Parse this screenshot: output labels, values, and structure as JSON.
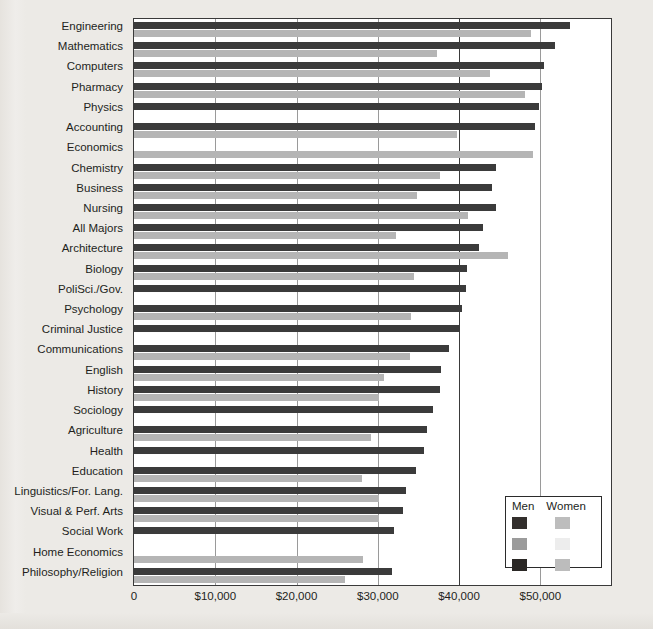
{
  "chart_data": {
    "type": "bar",
    "orientation": "horizontal",
    "title": "",
    "subtitle": "",
    "xlabel": "",
    "ylabel": "",
    "xlim": [
      0,
      58700
    ],
    "xticks": [
      0,
      10000,
      20000,
      30000,
      40000,
      50000
    ],
    "xtick_labels": [
      "0",
      "$10,000",
      "$20,000",
      "$30,000",
      "$40,000",
      "$50,000"
    ],
    "grid": true,
    "legend_position": "bottom-right",
    "categories": [
      "Engineering",
      "Mathematics",
      "Computers",
      "Pharmacy",
      "Physics",
      "Accounting",
      "Economics",
      "Chemistry",
      "Business",
      "Nursing",
      "All Majors",
      "Architecture",
      "Biology",
      "PoliSci./Gov.",
      "Psychology",
      "Criminal Justice",
      "Communications",
      "English",
      "History",
      "Sociology",
      "Agriculture",
      "Health",
      "Education",
      "Linguistics/For. Lang.",
      "Visual & Perf. Arts",
      "Social Work",
      "Home Economics",
      "Philosophy/Religion"
    ],
    "series": [
      {
        "name": "Men",
        "color": "#3b3b3b",
        "values": [
          53600,
          51800,
          50500,
          50200,
          49800,
          49300,
          0,
          44600,
          44000,
          44600,
          43000,
          42400,
          41000,
          40800,
          40400,
          40000,
          38800,
          37800,
          37700,
          36800,
          36000,
          35700,
          34700,
          33500,
          33100,
          32000,
          0,
          31800
        ]
      },
      {
        "name": "Women",
        "color": "#b5b5b5",
        "values": [
          48900,
          37300,
          43800,
          48100,
          0,
          39700,
          49100,
          37700,
          34800,
          41100,
          32200,
          46000,
          34500,
          0,
          34100,
          0,
          34000,
          30800,
          30200,
          0,
          29100,
          0,
          28000,
          30100,
          30200,
          0,
          28200,
          25900
        ]
      }
    ]
  },
  "legend": {
    "header_men": "Men",
    "header_women": "Women",
    "swatches": [
      {
        "men": "#332f2d",
        "women": "#bdbdbd"
      },
      {
        "men": "#9b9b9b",
        "women": "#ededed"
      },
      {
        "men": "#2b2826",
        "women": "#bcbcbc"
      }
    ]
  },
  "colors": {
    "men_bar": "#3b3b3b",
    "women_bar": "#b5b5b5",
    "axis": "#3a3a3a",
    "gridline": "#9a9a9a",
    "plot_background": "#ffffff",
    "page_background": "#eceae6",
    "text": "#231f1c"
  }
}
